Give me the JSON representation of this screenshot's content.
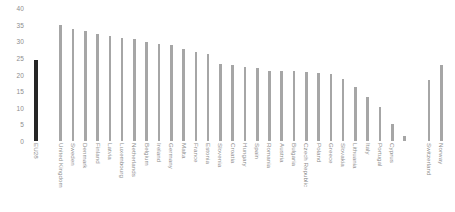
{
  "chart_data": {
    "type": "bar",
    "title": "",
    "subtitle": "",
    "xlabel": "",
    "ylabel": "",
    "ylim": [
      0,
      40
    ],
    "grid": false,
    "legend": "none",
    "ytick_labels": [
      "40",
      "35",
      "30",
      "25",
      "20",
      "15",
      "10",
      "5",
      "0"
    ],
    "ytick_values": [
      40,
      35,
      30,
      25,
      20,
      15,
      10,
      5,
      0
    ],
    "categories": [
      "EU28",
      "",
      "United Kingdom",
      "Sweden",
      "Denmark",
      "Finland",
      "Latvia",
      "Luxembourg",
      "Netherlands",
      "Belgium",
      "Ireland",
      "Germany",
      "Malta",
      "France",
      "Estonia",
      "Slovenia",
      "Croatia",
      "Hungary",
      "Spain",
      "Romania",
      "Austria",
      "Bulgaria",
      "Czech Republic",
      "Poland",
      "Greece",
      "Slovakia",
      "Lithuania",
      "Italy",
      "Portugal",
      "Cyprus",
      "",
      "",
      "Switzerland",
      "Norway"
    ],
    "values": [
      24.5,
      0,
      35.0,
      33.6,
      33.0,
      32.2,
      31.6,
      31.0,
      30.7,
      29.8,
      29.3,
      28.8,
      27.6,
      26.7,
      26.2,
      23.2,
      22.8,
      22.3,
      21.9,
      21.1,
      21.1,
      21.0,
      20.8,
      20.6,
      20.3,
      18.6,
      16.1,
      13.2,
      10.2,
      5.2,
      1.4,
      0,
      18.3,
      23.0
    ],
    "highlight_index": 0,
    "colors": {
      "bar": "#a6a6a6",
      "highlight_bar": "#262626",
      "tick_text": "#8d8d8d",
      "background": "#ffffff"
    }
  }
}
